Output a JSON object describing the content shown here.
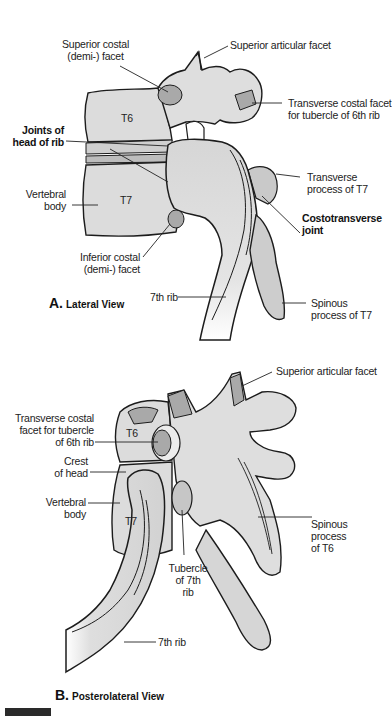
{
  "figure_a": {
    "caption_letter": "A.",
    "caption_text": "Lateral View",
    "labels": {
      "superior_costal_facet_1": "Superior costal",
      "superior_costal_facet_2": "(demi-) facet",
      "superior_articular_facet": "Superior articular facet",
      "transverse_costal_facet_1": "Transverse costal facet",
      "transverse_costal_facet_2": "for tubercle of 6th rib",
      "t6": "T6",
      "t7": "T7",
      "joints_head_rib_1": "Joints of",
      "joints_head_rib_2": "head of rib",
      "vertebral_body_1": "Vertebral",
      "vertebral_body_2": "body",
      "transverse_process_1": "Transverse",
      "transverse_process_2": "process of T7",
      "costotransverse_1": "Costotransverse",
      "costotransverse_2": "joint",
      "inferior_costal_facet_1": "Inferior costal",
      "inferior_costal_facet_2": "(demi-) facet",
      "seventh_rib": "7th rib",
      "spinous_process_1": "Spinous",
      "spinous_process_2": "process of T7"
    }
  },
  "figure_b": {
    "caption_letter": "B.",
    "caption_text": "Posterolateral View",
    "labels": {
      "superior_articular_facet": "Superior articular facet",
      "transverse_costal_facet_1": "Transverse costal",
      "transverse_costal_facet_2": "facet for tubercle",
      "transverse_costal_facet_3": "of 6th rib",
      "t6": "T6",
      "t7": "T7",
      "crest_of_head_1": "Crest",
      "crest_of_head_2": "of head",
      "vertebral_body_1": "Vertebral",
      "vertebral_body_2": "body",
      "spinous_process_1": "Spinous",
      "spinous_process_2": "process",
      "spinous_process_3": "of T6",
      "tubercle_1": "Tubercle",
      "tubercle_2": "of 7th",
      "tubercle_3": "rib",
      "seventh_rib": "7th rib"
    }
  },
  "colors": {
    "bone_fill": "#d9d9d9",
    "bone_light": "#e6e6e6",
    "facet_fill": "#a9a9a9",
    "outline": "#1c1c1c",
    "leader": "#222222"
  }
}
